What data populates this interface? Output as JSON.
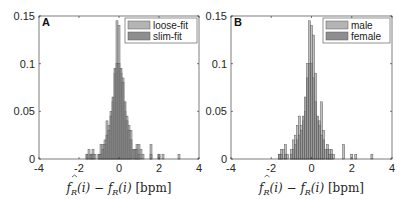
{
  "chart_data": [
    {
      "type": "bar",
      "panel_label": "A",
      "title": "",
      "xlabel": "f̂_R(i) − f_R(i) [bpm]",
      "ylabel": "",
      "xlim": [
        -4,
        4
      ],
      "ylim": [
        0,
        0.15
      ],
      "xticks": [
        -4,
        -2,
        0,
        2,
        4
      ],
      "yticks": [
        0,
        0.05,
        0.1,
        0.15
      ],
      "ytick_labels": [
        "0",
        "0.05",
        "0.1",
        "0.15"
      ],
      "grid": false,
      "legend_position": "upper right",
      "bin_width": 0.1,
      "series": [
        {
          "name": "loose-fit",
          "color": "#b4b4b4",
          "bins": [
            {
              "x": -1.6,
              "y": 0.005
            },
            {
              "x": -1.5,
              "y": 0.01
            },
            {
              "x": -1.4,
              "y": 0.005
            },
            {
              "x": -1.3,
              "y": 0.01
            },
            {
              "x": -1.2,
              "y": 0.005
            },
            {
              "x": -1.0,
              "y": 0.005
            },
            {
              "x": -0.9,
              "y": 0.015
            },
            {
              "x": -0.8,
              "y": 0.015
            },
            {
              "x": -0.7,
              "y": 0.02
            },
            {
              "x": -0.6,
              "y": 0.04
            },
            {
              "x": -0.5,
              "y": 0.035
            },
            {
              "x": -0.4,
              "y": 0.05
            },
            {
              "x": -0.3,
              "y": 0.06
            },
            {
              "x": -0.2,
              "y": 0.09
            },
            {
              "x": -0.1,
              "y": 0.145
            },
            {
              "x": 0.0,
              "y": 0.14
            },
            {
              "x": 0.1,
              "y": 0.09
            },
            {
              "x": 0.2,
              "y": 0.085
            },
            {
              "x": 0.3,
              "y": 0.05
            },
            {
              "x": 0.4,
              "y": 0.045
            },
            {
              "x": 0.5,
              "y": 0.035
            },
            {
              "x": 0.6,
              "y": 0.03
            },
            {
              "x": 0.8,
              "y": 0.01
            },
            {
              "x": 0.9,
              "y": 0.015
            },
            {
              "x": 1.0,
              "y": 0.015
            },
            {
              "x": 1.1,
              "y": 0.01
            },
            {
              "x": 1.2,
              "y": 0.005
            },
            {
              "x": 1.6,
              "y": 0.015
            },
            {
              "x": 2.0,
              "y": 0.005
            },
            {
              "x": 2.2,
              "y": 0.005
            },
            {
              "x": 3.0,
              "y": 0.005
            }
          ]
        },
        {
          "name": "slim-fit",
          "color": "#8e8e8e",
          "bins": [
            {
              "x": -1.6,
              "y": 0.005
            },
            {
              "x": -1.4,
              "y": 0.005
            },
            {
              "x": -1.3,
              "y": 0.005
            },
            {
              "x": -1.0,
              "y": 0.005
            },
            {
              "x": -0.9,
              "y": 0.005
            },
            {
              "x": -0.8,
              "y": 0.01
            },
            {
              "x": -0.7,
              "y": 0.015
            },
            {
              "x": -0.6,
              "y": 0.025
            },
            {
              "x": -0.5,
              "y": 0.03
            },
            {
              "x": -0.4,
              "y": 0.045
            },
            {
              "x": -0.3,
              "y": 0.065
            },
            {
              "x": -0.2,
              "y": 0.095
            },
            {
              "x": -0.1,
              "y": 0.1
            },
            {
              "x": 0.0,
              "y": 0.1
            },
            {
              "x": 0.1,
              "y": 0.095
            },
            {
              "x": 0.2,
              "y": 0.08
            },
            {
              "x": 0.3,
              "y": 0.06
            },
            {
              "x": 0.4,
              "y": 0.04
            },
            {
              "x": 0.5,
              "y": 0.03
            },
            {
              "x": 0.6,
              "y": 0.02
            },
            {
              "x": 0.7,
              "y": 0.01
            },
            {
              "x": 0.8,
              "y": 0.01
            },
            {
              "x": 0.9,
              "y": 0.01
            },
            {
              "x": 1.0,
              "y": 0.005
            },
            {
              "x": 1.6,
              "y": 0.005
            },
            {
              "x": 2.0,
              "y": 0.005
            }
          ]
        }
      ]
    },
    {
      "type": "bar",
      "panel_label": "B",
      "title": "",
      "xlabel": "f̂_R(i) − f_R(i) [bpm]",
      "ylabel": "",
      "xlim": [
        -4,
        4
      ],
      "ylim": [
        0,
        0.15
      ],
      "xticks": [
        -4,
        -2,
        0,
        2,
        4
      ],
      "yticks": [
        0,
        0.05,
        0.1,
        0.15
      ],
      "ytick_labels": [
        "0",
        "0.05",
        "0.1",
        "0.15"
      ],
      "grid": false,
      "legend_position": "upper right",
      "bin_width": 0.1,
      "series": [
        {
          "name": "male",
          "color": "#b4b4b4",
          "bins": [
            {
              "x": -1.6,
              "y": 0.005
            },
            {
              "x": -1.5,
              "y": 0.01
            },
            {
              "x": -1.4,
              "y": 0.01
            },
            {
              "x": -1.3,
              "y": 0.015
            },
            {
              "x": -1.2,
              "y": 0.005
            },
            {
              "x": -1.0,
              "y": 0.01
            },
            {
              "x": -0.9,
              "y": 0.02
            },
            {
              "x": -0.8,
              "y": 0.025
            },
            {
              "x": -0.7,
              "y": 0.035
            },
            {
              "x": -0.6,
              "y": 0.045
            },
            {
              "x": -0.5,
              "y": 0.035
            },
            {
              "x": -0.4,
              "y": 0.04
            },
            {
              "x": -0.3,
              "y": 0.05
            },
            {
              "x": -0.2,
              "y": 0.1
            },
            {
              "x": -0.1,
              "y": 0.145
            },
            {
              "x": 0.0,
              "y": 0.14
            },
            {
              "x": 0.1,
              "y": 0.13
            },
            {
              "x": 0.2,
              "y": 0.09
            },
            {
              "x": 0.3,
              "y": 0.04
            },
            {
              "x": 0.4,
              "y": 0.04
            },
            {
              "x": 0.5,
              "y": 0.06
            },
            {
              "x": 0.6,
              "y": 0.03
            },
            {
              "x": 0.8,
              "y": 0.015
            },
            {
              "x": 0.9,
              "y": 0.01
            },
            {
              "x": 1.0,
              "y": 0.01
            },
            {
              "x": 1.1,
              "y": 0.005
            },
            {
              "x": 1.6,
              "y": 0.015
            },
            {
              "x": 2.0,
              "y": 0.005
            },
            {
              "x": 2.2,
              "y": 0.005
            },
            {
              "x": 3.0,
              "y": 0.005
            }
          ]
        },
        {
          "name": "female",
          "color": "#8e8e8e",
          "bins": [
            {
              "x": -1.6,
              "y": 0.005
            },
            {
              "x": -1.5,
              "y": 0.005
            },
            {
              "x": -1.3,
              "y": 0.005
            },
            {
              "x": -1.0,
              "y": 0.005
            },
            {
              "x": -0.9,
              "y": 0.01
            },
            {
              "x": -0.8,
              "y": 0.015
            },
            {
              "x": -0.7,
              "y": 0.02
            },
            {
              "x": -0.6,
              "y": 0.025
            },
            {
              "x": -0.5,
              "y": 0.03
            },
            {
              "x": -0.4,
              "y": 0.045
            },
            {
              "x": -0.3,
              "y": 0.065
            },
            {
              "x": -0.2,
              "y": 0.085
            },
            {
              "x": -0.1,
              "y": 0.1
            },
            {
              "x": 0.0,
              "y": 0.1
            },
            {
              "x": 0.1,
              "y": 0.085
            },
            {
              "x": 0.2,
              "y": 0.06
            },
            {
              "x": 0.3,
              "y": 0.045
            },
            {
              "x": 0.4,
              "y": 0.035
            },
            {
              "x": 0.5,
              "y": 0.025
            },
            {
              "x": 0.6,
              "y": 0.02
            },
            {
              "x": 0.7,
              "y": 0.01
            },
            {
              "x": 0.8,
              "y": 0.01
            },
            {
              "x": 0.9,
              "y": 0.005
            },
            {
              "x": 1.0,
              "y": 0.005
            }
          ]
        }
      ]
    }
  ],
  "figure": {
    "panels": [
      {
        "label": "A",
        "legend": [
          "loose-fit",
          "slim-fit"
        ]
      },
      {
        "label": "B",
        "legend": [
          "male",
          "female"
        ]
      }
    ],
    "xlabel_parts": {
      "hat_f": "f",
      "sub_R": "R",
      "arg": "(i)",
      "minus": "−",
      "unit": "[bpm]"
    }
  }
}
